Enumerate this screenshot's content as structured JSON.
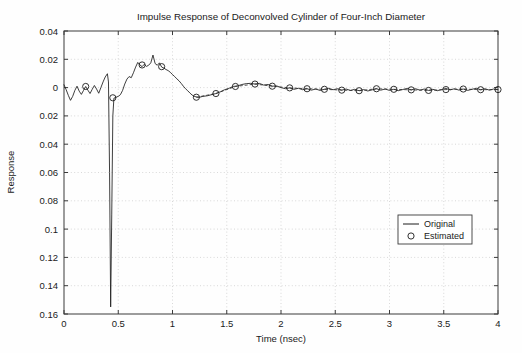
{
  "chart_data": {
    "type": "line",
    "title": "Impulse Response of Deconvolved Cylinder of Four-Inch Diameter",
    "xlabel": "Time (nsec)",
    "ylabel": "Response",
    "xlim": [
      0,
      4
    ],
    "ylim": [
      -0.16,
      0.04
    ],
    "grid": true,
    "legend_position": "lower right",
    "xticks": [
      0,
      0.5,
      1,
      1.5,
      2,
      2.5,
      3,
      3.5,
      4
    ],
    "xticklabels": [
      "0",
      "0.5",
      "1",
      "1.5",
      "2",
      "2.5",
      "3",
      "3.5",
      "4"
    ],
    "yticks": [
      0.04,
      0.02,
      0,
      -0.02,
      -0.04,
      -0.06,
      -0.08,
      -0.1,
      -0.12,
      -0.14,
      -0.16
    ],
    "yticklabels": [
      "0.04",
      "0.02",
      "0",
      "0.02",
      "0.04",
      "0.06",
      "0.08",
      "0.1",
      "0.12",
      "0.14",
      "0.16"
    ],
    "series": [
      {
        "name": "Original",
        "style": "solid-line",
        "x": [
          0.0,
          0.02,
          0.04,
          0.06,
          0.08,
          0.1,
          0.12,
          0.14,
          0.16,
          0.18,
          0.2,
          0.22,
          0.24,
          0.26,
          0.28,
          0.3,
          0.32,
          0.34,
          0.36,
          0.38,
          0.4,
          0.41,
          0.42,
          0.43,
          0.44,
          0.45,
          0.46,
          0.48,
          0.5,
          0.52,
          0.54,
          0.56,
          0.58,
          0.6,
          0.62,
          0.64,
          0.66,
          0.68,
          0.7,
          0.72,
          0.74,
          0.76,
          0.78,
          0.8,
          0.82,
          0.84,
          0.86,
          0.88,
          0.9,
          0.92,
          0.94,
          0.96,
          0.98,
          1.0,
          1.02,
          1.04,
          1.06,
          1.08,
          1.1,
          1.12,
          1.14,
          1.16,
          1.18,
          1.2,
          1.24,
          1.28,
          1.32,
          1.36,
          1.4,
          1.44,
          1.48,
          1.52,
          1.56,
          1.6,
          1.64,
          1.68,
          1.72,
          1.76,
          1.8,
          1.84,
          1.88,
          1.92,
          1.96,
          2.0,
          2.04,
          2.08,
          2.12,
          2.16,
          2.2,
          2.24,
          2.28,
          2.32,
          2.36,
          2.4,
          2.44,
          2.48,
          2.52,
          2.56,
          2.6,
          2.64,
          2.68,
          2.72,
          2.76,
          2.8,
          2.84,
          2.88,
          2.92,
          2.96,
          3.0,
          3.04,
          3.08,
          3.12,
          3.16,
          3.2,
          3.24,
          3.28,
          3.32,
          3.36,
          3.4,
          3.44,
          3.48,
          3.52,
          3.56,
          3.6,
          3.64,
          3.68,
          3.72,
          3.76,
          3.8,
          3.84,
          3.88,
          3.92,
          3.96,
          4.0
        ],
        "y": [
          0.002,
          -0.0015,
          -0.0055,
          -0.009,
          -0.0062,
          -0.002,
          0.001,
          -0.0025,
          -0.0048,
          -0.002,
          0.0008,
          -0.0018,
          -0.0042,
          -0.0012,
          0.0015,
          -0.001,
          -0.004,
          0.0,
          0.004,
          0.0075,
          0.0098,
          0.004,
          -0.06,
          -0.155,
          -0.09,
          -0.02,
          -0.0075,
          -0.0068,
          -0.0062,
          -0.005,
          -0.002,
          0.0025,
          0.006,
          0.0078,
          0.007,
          0.0105,
          0.0145,
          0.0178,
          0.016,
          0.0148,
          0.0165,
          0.015,
          0.0158,
          0.0175,
          0.023,
          0.017,
          0.0158,
          0.0175,
          0.0145,
          0.0138,
          0.0128,
          0.012,
          0.0108,
          0.0092,
          0.0078,
          0.0062,
          0.0048,
          0.003,
          0.001,
          -0.0008,
          -0.0022,
          -0.0038,
          -0.0052,
          -0.0062,
          -0.007,
          -0.0062,
          -0.0058,
          -0.005,
          -0.0042,
          -0.003,
          -0.0015,
          -0.0005,
          0.0008,
          0.0012,
          0.0022,
          0.0028,
          0.003,
          0.0025,
          0.003,
          0.0018,
          0.0022,
          0.001,
          0.0012,
          0.0,
          -0.0008,
          -0.0002,
          -0.0012,
          -0.0005,
          -0.0015,
          -0.0008,
          -0.0018,
          -0.001,
          -0.002,
          -0.0012,
          -0.0005,
          -0.0015,
          -0.0008,
          -0.0018,
          -0.001,
          -0.002,
          -0.0012,
          -0.0022,
          -0.0014,
          -0.0024,
          -0.0016,
          -0.0008,
          -0.0018,
          -0.001,
          -0.002,
          -0.0012,
          -0.0022,
          -0.0014,
          -0.0006,
          -0.0016,
          -0.0008,
          -0.0018,
          -0.001,
          -0.002,
          -0.0012,
          -0.0022,
          -0.0014,
          -0.0006,
          -0.0016,
          -0.0008,
          -0.0018,
          -0.001,
          -0.002,
          -0.0012,
          -0.0005,
          -0.0015,
          -0.0008,
          -0.0018,
          -0.001,
          -0.0014
        ]
      },
      {
        "name": "Estimated",
        "style": "circle-markers",
        "x": [
          0.2,
          0.45,
          0.72,
          0.9,
          1.22,
          1.4,
          1.58,
          1.76,
          1.92,
          2.08,
          2.24,
          2.4,
          2.56,
          2.72,
          2.88,
          3.04,
          3.2,
          3.36,
          3.52,
          3.68,
          3.84,
          4.0
        ],
        "y": [
          0.0008,
          -0.0072,
          0.016,
          0.0148,
          -0.0068,
          -0.0042,
          0.0008,
          0.0025,
          0.001,
          -0.0002,
          -0.0008,
          -0.0012,
          -0.0018,
          -0.0022,
          -0.0008,
          -0.0012,
          -0.0016,
          -0.002,
          -0.0014,
          -0.001,
          -0.0015,
          -0.0014
        ]
      }
    ]
  },
  "legend": {
    "entries": [
      {
        "label": "Original",
        "marker": "line"
      },
      {
        "label": "Estimated",
        "marker": "circle"
      }
    ]
  }
}
